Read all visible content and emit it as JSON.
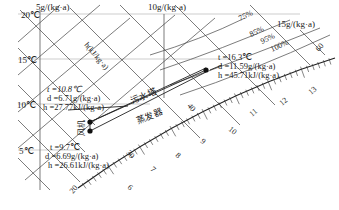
{
  "temperature_labels": [
    "20℃",
    "15℃",
    "10℃",
    "5℃"
  ],
  "humidity_ratio_labels": [
    "5g/(kg·a)",
    "10g/(kg·a)",
    "15g/(kg·a)"
  ],
  "enthalpy_axis_label": "h(kJ/kg·a)",
  "relative_humidity_labels": [
    "75%",
    "85%",
    "95%",
    "100%"
  ],
  "enthalpy_labels": [
    "20",
    "30",
    "40",
    "60"
  ],
  "saturation_scale_labels": [
    "6",
    "7",
    "8",
    "9",
    "10",
    "11",
    "12",
    "13"
  ],
  "points": {
    "state_a": {
      "t": "t =10.8℃",
      "d": "d =6.71g/(kg·a)",
      "h": "h =27.77kJ/(kg·a)"
    },
    "state_b": {
      "t": "t =9.7℃",
      "d": "d =6.69g/(kg·a)",
      "h": "h =26.61kJ/(kg·a)"
    },
    "state_c": {
      "t": "t =16.3℃",
      "d": "d =11.59g/(kg·a)",
      "h": "h =45.71kJ/(kg·a)"
    }
  },
  "process_labels": {
    "tower": "污水塔",
    "evaporator": "蒸发器",
    "fan": "风机"
  }
}
